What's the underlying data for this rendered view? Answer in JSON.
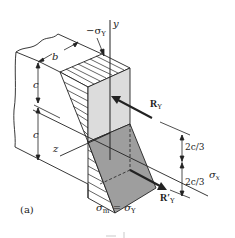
{
  "figure": {
    "label": "(a)",
    "colors": {
      "line": "#222222",
      "light_face": "#d9d9d9",
      "dark_face": "#9a9a9a",
      "background": "#ffffff"
    }
  },
  "labels": {
    "y_axis": "y",
    "z_axis": "z",
    "x_axis": "σ",
    "x_axis_sub": "x",
    "top_stress": "−σ",
    "top_stress_sub": "Y",
    "width": "b",
    "half_depth_upper": "c",
    "half_depth_lower": "c",
    "resultant_upper": "R",
    "resultant_upper_sub": "Y",
    "resultant_lower": "R′",
    "resultant_lower_sub": "Y",
    "dim_upper": "2c/3",
    "dim_lower": "2c/3",
    "max_stress_lhs": "σ",
    "max_stress_lhs_sub": "m",
    "max_stress_eq": " = σ",
    "max_stress_rhs_sub": "Y"
  }
}
